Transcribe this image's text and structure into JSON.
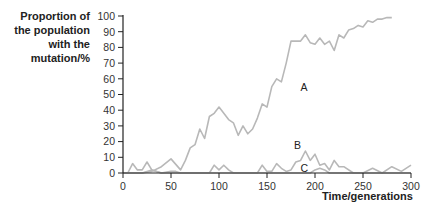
{
  "chart_data": {
    "type": "line",
    "title": "",
    "ylabel": [
      "Proportion of",
      "the population",
      "with the",
      "mutation/%"
    ],
    "xlabel": "Time/generations",
    "xlim": [
      0,
      300
    ],
    "ylim": [
      0,
      100
    ],
    "xticks": [
      0,
      50,
      100,
      150,
      200,
      250,
      300
    ],
    "yticks": [
      0,
      10,
      20,
      30,
      40,
      50,
      60,
      70,
      80,
      90,
      100
    ],
    "grid": false,
    "line_color": "#b8b8b8",
    "axis_color": "#222222",
    "series": [
      {
        "name": "A",
        "label_pos": [
          185,
          55
        ],
        "x": [
          0,
          10,
          20,
          30,
          40,
          50,
          60,
          65,
          70,
          75,
          80,
          85,
          90,
          95,
          100,
          105,
          110,
          115,
          120,
          125,
          130,
          135,
          140,
          145,
          150,
          155,
          160,
          165,
          170,
          175,
          180,
          185,
          190,
          195,
          200,
          205,
          210,
          215,
          220,
          225,
          230,
          235,
          240,
          245,
          250,
          255,
          260,
          265,
          270,
          275,
          280
        ],
        "values": [
          0,
          0,
          0,
          1,
          4,
          9,
          2,
          8,
          16,
          18,
          28,
          22,
          36,
          38,
          42,
          38,
          34,
          32,
          24,
          30,
          25,
          28,
          35,
          44,
          42,
          55,
          60,
          58,
          70,
          84,
          84,
          84,
          88,
          83,
          82,
          86,
          82,
          84,
          78,
          88,
          86,
          91,
          92,
          94,
          93,
          97,
          96,
          98,
          98,
          99,
          99
        ]
      },
      {
        "name": "B",
        "label_pos": [
          178,
          18
        ],
        "x": [
          0,
          5,
          10,
          15,
          20,
          25,
          30,
          35,
          40,
          50,
          60,
          80,
          90,
          95,
          100,
          105,
          110,
          115,
          130,
          140,
          145,
          150,
          155,
          160,
          165,
          170,
          175,
          180,
          185,
          190,
          195,
          200,
          205,
          210,
          215,
          220,
          225,
          230,
          240,
          250,
          260,
          270,
          280,
          290,
          300
        ],
        "values": [
          0,
          0,
          6,
          2,
          2,
          7,
          2,
          1,
          0,
          0,
          0,
          0,
          0,
          5,
          2,
          5,
          2,
          0,
          0,
          0,
          5,
          1,
          1,
          6,
          3,
          1,
          2,
          7,
          8,
          14,
          8,
          12,
          5,
          6,
          2,
          8,
          4,
          4,
          0,
          0,
          3,
          0,
          4,
          1,
          5
        ]
      },
      {
        "name": "C",
        "label_pos": [
          185,
          3
        ],
        "x": [
          0,
          20,
          30,
          40,
          50,
          55,
          60,
          100,
          180,
          190,
          195,
          200,
          205,
          210,
          215,
          220,
          250,
          300
        ],
        "values": [
          0,
          0,
          2,
          0,
          1,
          1,
          0,
          0,
          0,
          0,
          0,
          2,
          3,
          2,
          0,
          0,
          0,
          0
        ]
      }
    ]
  },
  "labels": {
    "ylabel_lines": [
      "Proportion of",
      "the population",
      "with the",
      "mutation/%"
    ],
    "xlabel": "Time/generations"
  }
}
